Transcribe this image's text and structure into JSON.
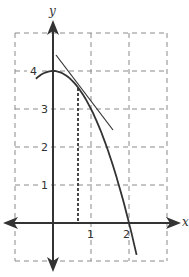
{
  "chart_data": {
    "type": "line",
    "title": "",
    "xlabel": "x",
    "ylabel": "y",
    "xlim": [
      -1,
      3
    ],
    "ylim": [
      -1,
      5
    ],
    "grid": true,
    "grid_style": "dashed",
    "x_ticks": [
      {
        "value": 1,
        "label": "1"
      },
      {
        "value": 2,
        "label": "2"
      }
    ],
    "y_ticks": [
      {
        "value": 1,
        "label": "1"
      },
      {
        "value": 2,
        "label": "2"
      },
      {
        "value": 3,
        "label": "3"
      },
      {
        "value": 4,
        "label": "4"
      }
    ],
    "series": [
      {
        "name": "curve",
        "function": "y = 4 - x^2",
        "x_range": [
          -0.45,
          2.2
        ],
        "style": "solid"
      },
      {
        "name": "tangent line",
        "point_of_tangency": [
          0.66,
          3.56
        ],
        "slope": -1.32,
        "x_range": [
          0.1,
          1.55
        ],
        "style": "solid"
      },
      {
        "name": "vertical reference",
        "x": 0.66,
        "y_range": [
          0,
          3.56
        ],
        "style": "dotted"
      }
    ],
    "colors": {
      "axis": "#333333",
      "grid": "#888888",
      "curve": "#333333"
    }
  }
}
